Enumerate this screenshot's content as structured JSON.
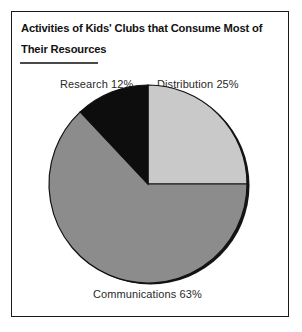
{
  "figure": {
    "title_lines": [
      "Activities of Kids' Clubs that Consume Most of",
      "Their Resources"
    ],
    "background_color": "#ffffff",
    "frame_color": "#1a1a1a",
    "rule_color": "#4a4a4a"
  },
  "labels": {
    "research": "Research 12%",
    "distribution": "Distribution 25%",
    "communications": "Communications 63%"
  },
  "chart_data": {
    "type": "pie",
    "title": "Activities of Kids' Clubs that Consume Most of Their Resources",
    "xlabel": "",
    "ylabel": "",
    "categories": [
      "Distribution",
      "Communications",
      "Research"
    ],
    "values": [
      25,
      63,
      12
    ],
    "value_unit": "%",
    "labels": [
      "Distribution 25%",
      "Communications 63%",
      "Research 12%"
    ],
    "colors": [
      "#c9c9c9",
      "#8c8c8c",
      "#0d0d0d"
    ],
    "start_angle_deg": 0,
    "direction": "clockwise",
    "slice_angles_deg": [
      90,
      226.8,
      43.2
    ],
    "legend": "none",
    "label_positions": [
      "top-right",
      "bottom-center",
      "top-left"
    ],
    "grid": false,
    "edge_color": "#111111",
    "has_drop_shadow": true
  }
}
